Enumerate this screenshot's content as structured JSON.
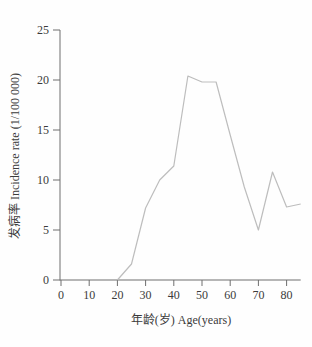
{
  "figure": {
    "background": "#fefefe"
  },
  "chart_data": {
    "type": "line",
    "title": "",
    "xlabel": "年龄(岁) Age(years)",
    "ylabel": "发病率 Incidence rate (1/100 000)",
    "x": [
      20,
      25,
      30,
      35,
      40,
      45,
      50,
      55,
      60,
      65,
      70,
      75,
      80,
      85
    ],
    "y": [
      0,
      1.6,
      7.2,
      10.0,
      11.4,
      20.4,
      19.8,
      19.8,
      14.5,
      9.3,
      5.0,
      10.8,
      7.3,
      7.6
    ],
    "xticks": [
      0,
      10,
      20,
      30,
      40,
      50,
      60,
      70,
      80
    ],
    "yticks": [
      0,
      5,
      10,
      15,
      20,
      25
    ],
    "xlim": [
      0,
      85
    ],
    "ylim": [
      0,
      25
    ],
    "grid": false,
    "legend_position": "none",
    "line_color": "#bdbdbd",
    "axis_color": "#6e6e6e",
    "tick_label_color": "#3b3b3b"
  }
}
